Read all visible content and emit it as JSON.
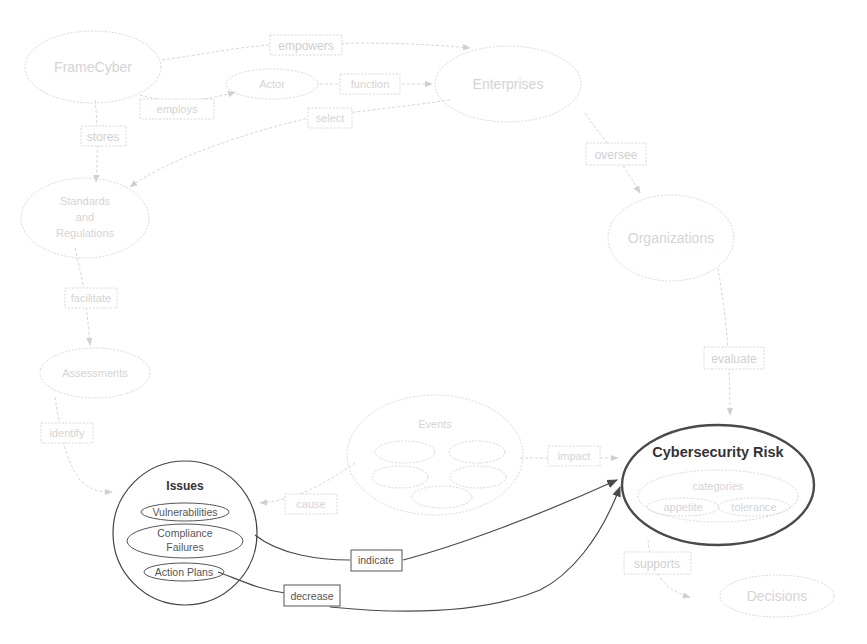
{
  "diagram": {
    "nodes": {
      "framecyber": "FrameCyber",
      "enterprises": "Enterprises",
      "actor": "Actor",
      "function": "function",
      "standards_line1": "Standards",
      "standards_line2": "and",
      "standards_line3": "Regulations",
      "organizations": "Organizations",
      "assessments": "Assessments",
      "events": "Events",
      "issues": {
        "title": "Issues",
        "children": [
          "Vulnerabilities",
          "Compliance",
          "Failures",
          "Action Plans"
        ]
      },
      "cyber_risk": {
        "title": "Cybersecurity Risk",
        "categories_title": "categories",
        "categories": [
          "appetite",
          "tolerance"
        ]
      },
      "decisions": "Decisions"
    },
    "edges": {
      "empowers": "empowers",
      "employs": "employs",
      "performs": "performs",
      "stores": "stores",
      "select": "select",
      "oversee": "oversee",
      "facilitate": "facilitate",
      "evaluate": "evaluate",
      "identify": "identify",
      "events_to_issues": "cause",
      "events_to_risk": "impact",
      "indicate": "indicate",
      "decrease": "decrease",
      "supports": "supports"
    },
    "colors": {
      "active_stroke": "#444444",
      "faded_stroke": "#d8d8d8",
      "faded_text": "#d4d4d4"
    }
  }
}
